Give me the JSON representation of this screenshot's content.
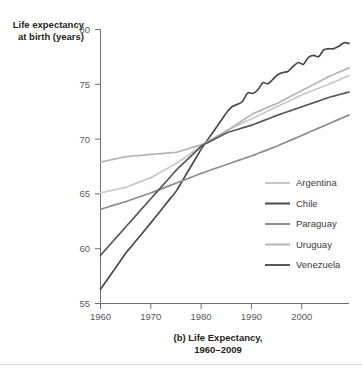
{
  "chart_data": {
    "type": "line",
    "title": "(b) Life Expectancy,",
    "title_line2": "1960–2009",
    "ylabel_line1": "Life expectancy",
    "ylabel_line2": "at birth (years)",
    "xlabel": "",
    "xlim": [
      1960,
      2009
    ],
    "ylim": [
      55,
      80
    ],
    "yticks": [
      55,
      60,
      65,
      70,
      75,
      80
    ],
    "ytick_labels": [
      "55",
      "60",
      "65",
      "70",
      "75",
      "80"
    ],
    "xticks": [
      1960,
      1970,
      1980,
      1990,
      2000
    ],
    "xtick_labels": [
      "1960",
      "1970",
      "1980",
      "1990",
      "2000"
    ],
    "grid": false,
    "legend_position": "inside-lower-right",
    "x": [
      1960,
      1965,
      1970,
      1975,
      1980,
      1985,
      1990,
      1995,
      2000,
      2005,
      2009
    ],
    "series": [
      {
        "name": "Argentina",
        "color": "#c9c9c9",
        "values": [
          65.1,
          65.6,
          66.5,
          67.8,
          69.4,
          70.8,
          71.9,
          73.0,
          74.1,
          75.0,
          75.8
        ]
      },
      {
        "name": "Chile",
        "color": "#4a4a4a",
        "values": [
          56.3,
          59.6,
          62.4,
          65.3,
          69.2,
          72.5,
          74.3,
          75.8,
          77.1,
          78.2,
          78.8
        ]
      },
      {
        "name": "Paraguay",
        "color": "#8d8d8d",
        "values": [
          63.6,
          64.3,
          65.1,
          66.0,
          66.9,
          67.7,
          68.5,
          69.4,
          70.4,
          71.4,
          72.2
        ]
      },
      {
        "name": "Uruguay",
        "color": "#b4b4b4",
        "values": [
          67.9,
          68.4,
          68.6,
          68.8,
          69.5,
          70.8,
          72.3,
          73.3,
          74.5,
          75.7,
          76.5
        ]
      },
      {
        "name": "Venezuela",
        "color": "#585858",
        "values": [
          59.4,
          62.0,
          64.6,
          67.2,
          69.4,
          70.6,
          71.3,
          72.2,
          73.0,
          73.8,
          74.3
        ]
      }
    ]
  },
  "legend": {
    "entries": [
      "Argentina",
      "Chile",
      "Paraguay",
      "Uruguay",
      "Venezuela"
    ]
  }
}
